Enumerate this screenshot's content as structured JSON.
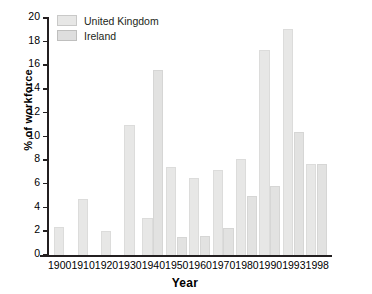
{
  "chart_data": {
    "type": "bar",
    "title": "",
    "xlabel": "Year",
    "ylabel": "% of workforce",
    "categories": [
      "1900",
      "1910",
      "1920",
      "1930",
      "1940",
      "1950",
      "1960",
      "1970",
      "1980",
      "1990",
      "1993",
      "1998"
    ],
    "series": [
      {
        "name": "United Kingdom",
        "color": "#e7e7e6",
        "values": [
          2.4,
          4.7,
          2.0,
          11.0,
          3.1,
          7.4,
          6.5,
          7.2,
          8.1,
          17.3,
          19.1,
          7.7
        ]
      },
      {
        "name": "Ireland",
        "color": "#dedede",
        "values": [
          null,
          null,
          null,
          null,
          15.6,
          1.5,
          1.6,
          2.3,
          5.0,
          5.8,
          10.4,
          7.7
        ]
      }
    ],
    "ylim": [
      0,
      20
    ],
    "yticks": [
      0,
      2,
      4,
      6,
      8,
      10,
      12,
      14,
      16,
      18,
      20
    ],
    "ytick_labels": [
      "0",
      "2",
      "4",
      "6",
      "8",
      "10",
      "12",
      "14",
      "16",
      "18",
      "20"
    ],
    "grid": false,
    "legend_position": "top-left"
  },
  "legend": {
    "items": [
      {
        "label": "United Kingdom"
      },
      {
        "label": "Ireland"
      }
    ]
  },
  "axes": {
    "x_title": "Year",
    "y_title": "% of workforce"
  }
}
